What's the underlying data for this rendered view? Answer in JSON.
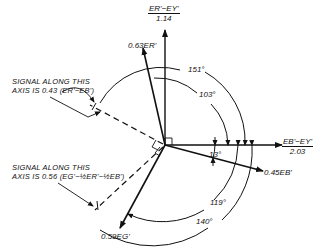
{
  "axes": {
    "vertical": {
      "numerator": "E_R'−E_Y'",
      "denominator": "1.14",
      "numerator_display": "ER'−EY'"
    },
    "horizontal": {
      "numerator": "E_B'−E_Y'",
      "denominator": "2.03",
      "numerator_display": "EB'−EY'"
    }
  },
  "vectors": {
    "red": "0.63E_R'",
    "red_display": "0.63ER'",
    "blue": "0.45E_B'",
    "blue_display": "0.45EB'",
    "green": "0.59E_G'",
    "green_display": "0.59EG'"
  },
  "angles": [
    "151°",
    "103°",
    "13°",
    "119°",
    "140°"
  ],
  "annotations": {
    "upper": {
      "line1": "SIGNAL ALONG THIS",
      "line2": "AXIS IS 0.43 (ER'−EB')"
    },
    "lower": {
      "line1": "SIGNAL ALONG THIS",
      "line2": "AXIS IS 0.56 (EG'−½ER'−½EB')"
    }
  }
}
